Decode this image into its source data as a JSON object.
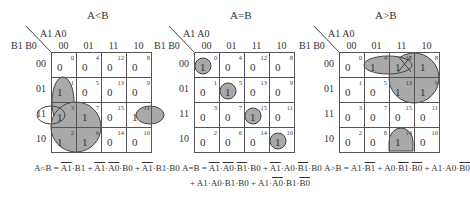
{
  "maps": [
    {
      "title": "A<B",
      "col_var_label": "A1 A0",
      "row_var_label": "B1 B0",
      "col_headers": [
        "00",
        "01",
        "11",
        "10"
      ],
      "row_headers": [
        "00",
        "01",
        "11",
        "10"
      ],
      "cells": [
        [
          {
            "idx": "0",
            "val": "0"
          },
          {
            "idx": "4",
            "val": "0"
          },
          {
            "idx": "12",
            "val": "0"
          },
          {
            "idx": "8",
            "val": "0"
          }
        ],
        [
          {
            "idx": "1",
            "val": "1"
          },
          {
            "idx": "5",
            "val": "0"
          },
          {
            "idx": "13",
            "val": "0"
          },
          {
            "idx": "9",
            "val": "0"
          }
        ],
        [
          {
            "idx": "3",
            "val": "1"
          },
          {
            "idx": "7",
            "val": "1"
          },
          {
            "idx": "15",
            "val": "0"
          },
          {
            "idx": "11",
            "val": "1"
          }
        ],
        [
          {
            "idx": "2",
            "val": "1"
          },
          {
            "idx": "6",
            "val": "1"
          },
          {
            "idx": "14",
            "val": "0"
          },
          {
            "idx": "10",
            "val": "0"
          }
        ]
      ],
      "formula": {
        "lhs": "A<B = ",
        "terms": [
          [
            {
              "t": "A1",
              "ov": true
            },
            {
              "t": "·B1",
              "ov": false
            }
          ],
          [
            {
              "t": " + ",
              "ov": false
            },
            {
              "t": "A1",
              "ov": true
            },
            {
              "t": "·",
              "ov": false
            },
            {
              "t": "A0",
              "ov": true
            },
            {
              "t": "·B0",
              "ov": false
            }
          ],
          [
            {
              "t": " + ",
              "ov": false
            },
            {
              "t": "A1",
              "ov": true
            },
            {
              "t": "·B1·B0",
              "ov": false
            }
          ]
        ]
      }
    },
    {
      "title": "A=B",
      "col_var_label": "A1 A0",
      "row_var_label": "B1 B0",
      "col_headers": [
        "00",
        "01",
        "11",
        "10"
      ],
      "row_headers": [
        "00",
        "01",
        "11",
        "10"
      ],
      "cells": [
        [
          {
            "idx": "0",
            "val": "1"
          },
          {
            "idx": "4",
            "val": "0"
          },
          {
            "idx": "12",
            "val": "0"
          },
          {
            "idx": "8",
            "val": "0"
          }
        ],
        [
          {
            "idx": "1",
            "val": "0"
          },
          {
            "idx": "5",
            "val": "1"
          },
          {
            "idx": "13",
            "val": "0"
          },
          {
            "idx": "9",
            "val": "0"
          }
        ],
        [
          {
            "idx": "3",
            "val": "0"
          },
          {
            "idx": "7",
            "val": "0"
          },
          {
            "idx": "15",
            "val": "1"
          },
          {
            "idx": "11",
            "val": "0"
          }
        ],
        [
          {
            "idx": "2",
            "val": "0"
          },
          {
            "idx": "6",
            "val": "0"
          },
          {
            "idx": "14",
            "val": "0"
          },
          {
            "idx": "10",
            "val": "1"
          }
        ]
      ],
      "formula_line1": "A=B = A1·A0·B1·B0 + A1·A0·B1·B0",
      "formula_line2": "+ A1·A0·B1·B0 + A1·A0·B1·B0"
    },
    {
      "title": "A>B",
      "col_var_label": "A1 A0",
      "row_var_label": "B1 B0",
      "col_headers": [
        "00",
        "01",
        "11",
        "10"
      ],
      "row_headers": [
        "00",
        "01",
        "11",
        "10"
      ],
      "cells": [
        [
          {
            "idx": "0",
            "val": "0"
          },
          {
            "idx": "4",
            "val": "1"
          },
          {
            "idx": "12",
            "val": "1"
          },
          {
            "idx": "8",
            "val": "1"
          }
        ],
        [
          {
            "idx": "1",
            "val": "0"
          },
          {
            "idx": "5",
            "val": "0"
          },
          {
            "idx": "13",
            "val": "1"
          },
          {
            "idx": "9",
            "val": "1"
          }
        ],
        [
          {
            "idx": "3",
            "val": "0"
          },
          {
            "idx": "7",
            "val": "0"
          },
          {
            "idx": "15",
            "val": "0"
          },
          {
            "idx": "11",
            "val": "0"
          }
        ],
        [
          {
            "idx": "2",
            "val": "0"
          },
          {
            "idx": "6",
            "val": "0"
          },
          {
            "idx": "14",
            "val": "1"
          },
          {
            "idx": "10",
            "val": "0"
          }
        ]
      ]
    }
  ],
  "formulas": {
    "lt": {
      "p1": "A<B = ",
      "a1": "A1",
      "p2": "·B1 + ",
      "a2": "A1",
      "p3": "·",
      "a3": "A0",
      "p4": "·B0 + ",
      "a4": "A1",
      "p5": "·B1·B0"
    },
    "eq1": {
      "p1": "A=B = ",
      "a1": "A1",
      "p2": "·",
      "a2": "A0",
      "p3": "·",
      "a3": "B1",
      "p4": "·B0 + ",
      "a4": "A1",
      "p5": "·A0·",
      "a5": "B1",
      "p6": "·B0"
    },
    "eq2": {
      "p1": "+ A1·A0·B1·B0 + A1·",
      "a1": "A0",
      "p2": "·B1·",
      "a2": "B0"
    },
    "gt": {
      "p1": "A>B = A1·",
      "a1": "B1",
      "p2": " + A0·",
      "a2": "B1",
      "p3": "·",
      "a3": "B0",
      "p4": " + A1·A0·",
      "a4": "B0"
    }
  },
  "colors": {
    "group_fill": "#a9a9a9",
    "group_stroke": "#444444",
    "grid_line": "#555555"
  }
}
